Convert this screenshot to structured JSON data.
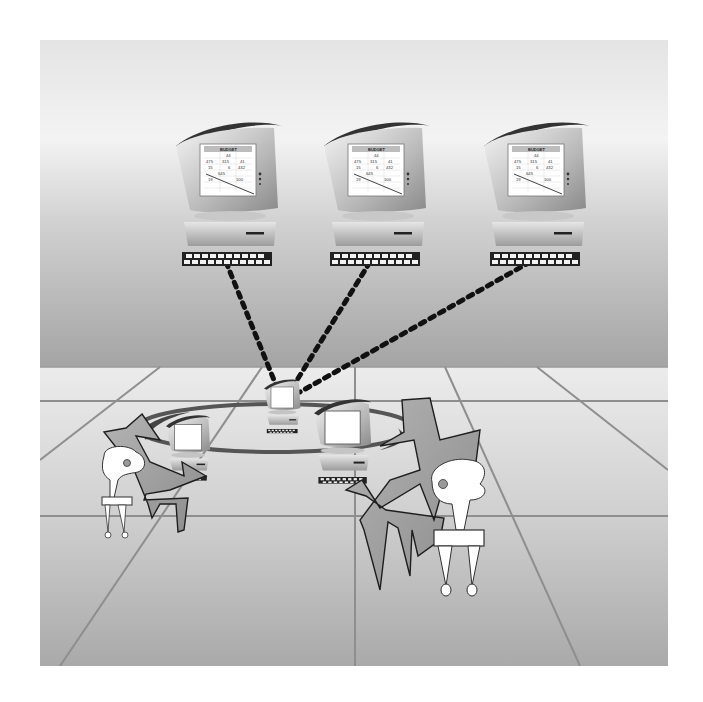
{
  "illustration": {
    "description": "Networked computers: three remote workstations connected by dotted cables to a central hub computer on a round table with two seated users",
    "colors": {
      "background": "#ffffff",
      "wall_top": "#e6e6e6",
      "wall_bottom": "#a6a6a6",
      "floor_top": "#e8e8e8",
      "floor_bottom": "#a8a8a8",
      "grid_line": "#8e8e8e",
      "figure_fill": "#9a9a9a",
      "figure_stroke": "#1e1e1e",
      "cable": "#111111",
      "screen": "#ffffff"
    }
  },
  "remote_computers": [
    {
      "id": "left",
      "screen": {
        "title": "BUDGET",
        "rows": [
          [
            "",
            "44",
            ""
          ],
          [
            "475",
            "315",
            "41"
          ],
          [
            "15",
            "6",
            "432"
          ],
          [
            "",
            "645",
            ""
          ],
          [
            "19",
            "",
            "100"
          ]
        ]
      }
    },
    {
      "id": "center",
      "screen": {
        "title": "BUDGET",
        "rows": [
          [
            "",
            "44",
            ""
          ],
          [
            "475",
            "315",
            "41"
          ],
          [
            "15",
            "6",
            "432"
          ],
          [
            "",
            "645",
            ""
          ],
          [
            "19",
            "",
            "100"
          ]
        ]
      }
    },
    {
      "id": "right",
      "screen": {
        "title": "BUDGET",
        "rows": [
          [
            "",
            "44",
            ""
          ],
          [
            "475",
            "315",
            "41"
          ],
          [
            "15",
            "6",
            "432"
          ],
          [
            "",
            "645",
            ""
          ],
          [
            "19",
            "",
            "100"
          ]
        ]
      }
    }
  ],
  "hub": {
    "label": "central-computer"
  },
  "users": [
    {
      "id": "left-user"
    },
    {
      "id": "right-user"
    }
  ]
}
